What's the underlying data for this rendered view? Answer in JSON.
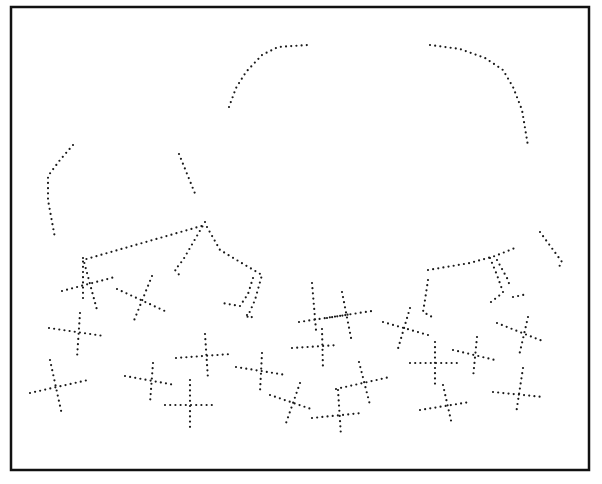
{
  "figure": {
    "width": 602,
    "height": 484,
    "background": "#ffffff",
    "border": {
      "x": 11,
      "y": 7,
      "width": 578,
      "height": 463,
      "color": "#111111",
      "stroke": 2.5
    },
    "dot_color": "#1a1a1a",
    "dot_radius": 1.1,
    "dot_spacing": 5.2
  },
  "outline_segments": [
    {
      "name": "left-arc",
      "points": [
        [
          229,
          107
        ],
        [
          236,
          88
        ],
        [
          246,
          72
        ],
        [
          262,
          55
        ],
        [
          278,
          47
        ],
        [
          308,
          45
        ]
      ]
    },
    {
      "name": "right-arc",
      "points": [
        [
          430,
          45
        ],
        [
          460,
          49
        ],
        [
          485,
          58
        ],
        [
          503,
          70
        ],
        [
          513,
          87
        ],
        [
          522,
          110
        ],
        [
          528,
          146
        ]
      ]
    },
    {
      "name": "far-left-arm",
      "points": [
        [
          73,
          145
        ],
        [
          60,
          160
        ],
        [
          48,
          176
        ],
        [
          48,
          200
        ],
        [
          55,
          238
        ]
      ]
    },
    {
      "name": "mid-left-stub",
      "points": [
        [
          179,
          154
        ],
        [
          196,
          196
        ]
      ]
    },
    {
      "name": "left-body-edge",
      "points": [
        [
          83,
          298
        ],
        [
          83,
          260
        ],
        [
          205,
          225
        ]
      ]
    },
    {
      "name": "left-leg-a",
      "points": [
        [
          205,
          222
        ],
        [
          183,
          260
        ],
        [
          175,
          270
        ],
        [
          182,
          278
        ]
      ]
    },
    {
      "name": "left-leg-b",
      "points": [
        [
          207,
          227
        ],
        [
          220,
          250
        ],
        [
          240,
          262
        ],
        [
          262,
          275
        ],
        [
          255,
          300
        ],
        [
          247,
          318
        ]
      ]
    },
    {
      "name": "left-leg-c",
      "points": [
        [
          253,
          278
        ],
        [
          248,
          294
        ],
        [
          240,
          306
        ],
        [
          222,
          303
        ]
      ]
    },
    {
      "name": "left-leg-tip",
      "points": [
        [
          247,
          315
        ],
        [
          256,
          319
        ]
      ]
    },
    {
      "name": "right-body-edge",
      "points": [
        [
          428,
          270
        ],
        [
          470,
          263
        ],
        [
          495,
          256
        ],
        [
          515,
          248
        ]
      ]
    },
    {
      "name": "right-body-down",
      "points": [
        [
          428,
          280
        ],
        [
          425,
          300
        ],
        [
          423,
          312
        ],
        [
          434,
          318
        ]
      ]
    },
    {
      "name": "right-leg-a",
      "points": [
        [
          490,
          258
        ],
        [
          497,
          275
        ],
        [
          503,
          292
        ]
      ]
    },
    {
      "name": "right-leg-b",
      "points": [
        [
          497,
          260
        ],
        [
          507,
          278
        ],
        [
          510,
          286
        ]
      ]
    },
    {
      "name": "right-leg-c",
      "points": [
        [
          491,
          302
        ],
        [
          500,
          295
        ]
      ]
    },
    {
      "name": "right-leg-tip",
      "points": [
        [
          513,
          297
        ],
        [
          528,
          294
        ]
      ]
    },
    {
      "name": "far-right-arm",
      "points": [
        [
          540,
          232
        ],
        [
          551,
          247
        ],
        [
          562,
          262
        ],
        [
          557,
          270
        ]
      ]
    }
  ],
  "crosses": [
    {
      "a": [
        [
          62,
          291
        ],
        [
          115,
          277
        ]
      ],
      "b": [
        [
          83,
          258
        ],
        [
          97,
          310
        ]
      ]
    },
    {
      "a": [
        [
          117,
          289
        ],
        [
          167,
          312
        ]
      ],
      "b": [
        [
          152,
          276
        ],
        [
          133,
          323
        ]
      ]
    },
    {
      "a": [
        [
          49,
          328
        ],
        [
          104,
          336
        ]
      ],
      "b": [
        [
          80,
          313
        ],
        [
          77,
          358
        ]
      ]
    },
    {
      "a": [
        [
          30,
          393
        ],
        [
          88,
          380
        ]
      ],
      "b": [
        [
          50,
          360
        ],
        [
          62,
          415
        ]
      ]
    },
    {
      "a": [
        [
          125,
          376
        ],
        [
          175,
          385
        ]
      ],
      "b": [
        [
          153,
          363
        ],
        [
          150,
          403
        ]
      ]
    },
    {
      "a": [
        [
          165,
          405
        ],
        [
          215,
          405
        ]
      ],
      "b": [
        [
          190,
          380
        ],
        [
          190,
          427
        ]
      ]
    },
    {
      "a": [
        [
          176,
          358
        ],
        [
          231,
          354
        ]
      ],
      "b": [
        [
          205,
          334
        ],
        [
          208,
          379
        ]
      ]
    },
    {
      "a": [
        [
          236,
          367
        ],
        [
          286,
          375
        ]
      ],
      "b": [
        [
          262,
          353
        ],
        [
          260,
          392
        ]
      ]
    },
    {
      "a": [
        [
          270,
          395
        ],
        [
          314,
          410
        ]
      ],
      "b": [
        [
          300,
          383
        ],
        [
          285,
          426
        ]
      ]
    },
    {
      "a": [
        [
          292,
          348
        ],
        [
          338,
          345
        ]
      ],
      "b": [
        [
          322,
          329
        ],
        [
          323,
          370
        ]
      ]
    },
    {
      "a": [
        [
          299,
          322
        ],
        [
          372,
          311
        ]
      ],
      "b": [
        [
          312,
          283
        ],
        [
          316,
          330
        ]
      ]
    },
    {
      "a": [
        [
          327,
          318
        ],
        [
          352,
          314
        ]
      ],
      "b": [
        [
          342,
          292
        ],
        [
          352,
          343
        ]
      ]
    },
    {
      "a": [
        [
          336,
          389
        ],
        [
          390,
          377
        ]
      ],
      "b": [
        [
          359,
          362
        ],
        [
          370,
          405
        ]
      ]
    },
    {
      "a": [
        [
          312,
          418
        ],
        [
          362,
          413
        ]
      ],
      "b": [
        [
          338,
          390
        ],
        [
          341,
          436
        ]
      ]
    },
    {
      "a": [
        [
          383,
          322
        ],
        [
          428,
          335
        ]
      ],
      "b": [
        [
          410,
          308
        ],
        [
          397,
          352
        ]
      ]
    },
    {
      "a": [
        [
          410,
          363
        ],
        [
          460,
          363
        ]
      ],
      "b": [
        [
          435,
          342
        ],
        [
          435,
          388
        ]
      ]
    },
    {
      "a": [
        [
          453,
          350
        ],
        [
          495,
          360
        ]
      ],
      "b": [
        [
          477,
          337
        ],
        [
          473,
          378
        ]
      ]
    },
    {
      "a": [
        [
          420,
          410
        ],
        [
          470,
          402
        ]
      ],
      "b": [
        [
          443,
          385
        ],
        [
          452,
          425
        ]
      ]
    },
    {
      "a": [
        [
          497,
          323
        ],
        [
          545,
          342
        ]
      ],
      "b": [
        [
          528,
          317
        ],
        [
          519,
          356
        ]
      ]
    },
    {
      "a": [
        [
          493,
          392
        ],
        [
          543,
          397
        ]
      ],
      "b": [
        [
          523,
          368
        ],
        [
          516,
          414
        ]
      ]
    }
  ]
}
